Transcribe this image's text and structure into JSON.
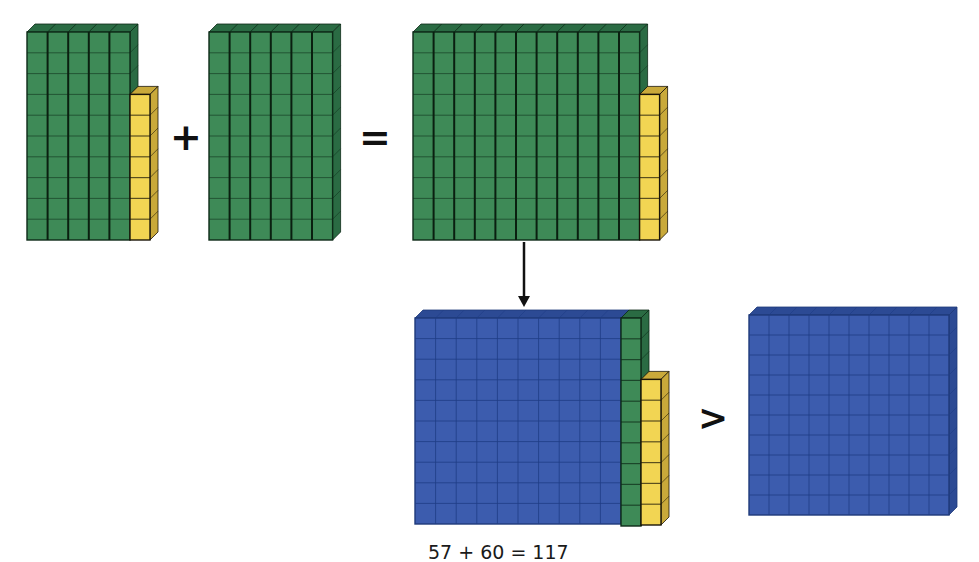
{
  "diagram": {
    "colors": {
      "ten_rod": "#3e8a57",
      "ten_rod_dark": "#2a6b43",
      "unit_cube": "#f2d553",
      "unit_cube_dark": "#c9a93a",
      "hundred_flat": "#3c5cae",
      "hundred_flat_dark": "#2c4a94",
      "grid_line": "#0d2a17",
      "symbol": "#111111"
    },
    "symbols": {
      "plus": "+",
      "equals": "=",
      "greater_than": ">"
    },
    "blocks": [
      {
        "id": "addend-57",
        "value": 57,
        "hundreds": 0,
        "tens": 5,
        "ones": 7
      },
      {
        "id": "addend-60",
        "value": 60,
        "hundreds": 0,
        "tens": 6,
        "ones": 0
      },
      {
        "id": "sum-117-tens",
        "value": 117,
        "hundreds": 0,
        "tens": 11,
        "ones": 7
      },
      {
        "id": "sum-117-regrouped",
        "value": 117,
        "hundreds": 1,
        "tens": 1,
        "ones": 7
      },
      {
        "id": "compare-100",
        "value": 100,
        "hundreds": 1,
        "tens": 0,
        "ones": 0
      }
    ],
    "arrow": {
      "from": "sum-117-tens",
      "to": "sum-117-regrouped",
      "meaning": "regroup 10 tens into 1 hundred"
    },
    "caption": "57 + 60 = 117"
  }
}
